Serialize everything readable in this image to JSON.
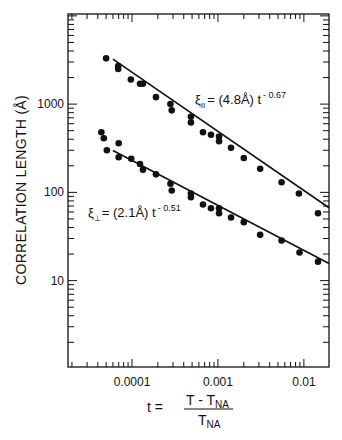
{
  "chart_data": {
    "type": "scatter",
    "title": "",
    "xlabel": {
      "lhs": "t =",
      "numerator_main": "T - T",
      "numerator_sub": "NA",
      "denominator_main": "T",
      "denominator_sub": "NA"
    },
    "ylabel": "CORRELATION LENGTH (Å)",
    "xscale": "log",
    "yscale": "log",
    "xlim": [
      1.8e-05,
      0.0196
    ],
    "ylim": [
      1.05,
      10500
    ],
    "grid": false,
    "x_ticks": [
      {
        "value": 0.0001,
        "label": "0.0001"
      },
      {
        "value": 0.001,
        "label": "0.001"
      },
      {
        "value": 0.01,
        "label": "0.01"
      }
    ],
    "y_ticks": [
      {
        "value": 10,
        "label": "10"
      },
      {
        "value": 100,
        "label": "100"
      },
      {
        "value": 1000,
        "label": "1000"
      }
    ],
    "series": [
      {
        "name": "xi_parallel",
        "marker": "filled-circle",
        "color": "#111111",
        "points": [
          [
            5e-05,
            3300
          ],
          [
            6.9e-05,
            2700
          ],
          [
            6.9e-05,
            2500
          ],
          [
            9.7e-05,
            1900
          ],
          [
            0.000124,
            1700
          ],
          [
            0.000134,
            1700
          ],
          [
            0.00019,
            1200
          ],
          [
            0.00028,
            1000
          ],
          [
            0.00029,
            850
          ],
          [
            0.000485,
            720
          ],
          [
            0.000485,
            620
          ],
          [
            0.00067,
            480
          ],
          [
            0.00083,
            450
          ],
          [
            0.00103,
            430
          ],
          [
            0.00103,
            380
          ],
          [
            0.00142,
            320
          ],
          [
            0.002,
            245
          ],
          [
            0.0031,
            185
          ],
          [
            0.0055,
            130
          ],
          [
            0.00875,
            97
          ],
          [
            0.0146,
            58
          ]
        ],
        "fit": {
          "amplitude": 4.8,
          "exponent": -0.67,
          "x_range": [
            6e-05,
            0.0196
          ]
        },
        "annotation": {
          "symbol": "ξ",
          "subscript": "II",
          "text": "= (4.8Å) t",
          "superscript": "- 0.67",
          "anchor": [
            0.00065,
            1260
          ]
        }
      },
      {
        "name": "xi_perpendicular",
        "marker": "filled-circle",
        "color": "#111111",
        "points": [
          [
            4.4e-05,
            480
          ],
          [
            4.7e-05,
            410
          ],
          [
            5.1e-05,
            300
          ],
          [
            7e-05,
            360
          ],
          [
            7e-05,
            250
          ],
          [
            9.8e-05,
            240
          ],
          [
            0.000124,
            210
          ],
          [
            0.000134,
            180
          ],
          [
            0.00019,
            160
          ],
          [
            0.00028,
            125
          ],
          [
            0.00029,
            105
          ],
          [
            0.000485,
            97
          ],
          [
            0.000485,
            88
          ],
          [
            0.00067,
            73
          ],
          [
            0.00083,
            66
          ],
          [
            0.00103,
            66
          ],
          [
            0.00103,
            58
          ],
          [
            0.00142,
            52
          ],
          [
            0.002,
            46
          ],
          [
            0.0031,
            33
          ],
          [
            0.0055,
            28.5
          ],
          [
            0.0089,
            20.8
          ],
          [
            0.0146,
            16.4
          ]
        ],
        "fit": {
          "amplitude": 2.1,
          "exponent": -0.51,
          "x_range": [
            6e-05,
            0.0196
          ]
        },
        "annotation": {
          "symbol": "ξ",
          "subscript": "⊥",
          "text": "= (2.1Å) t",
          "superscript": "- 0.51",
          "anchor": [
            3.4e-05,
            62
          ]
        }
      }
    ]
  }
}
